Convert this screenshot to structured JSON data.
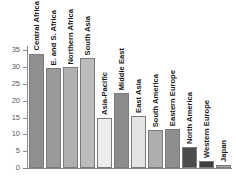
{
  "chart_data": {
    "type": "bar",
    "title": "",
    "subtitle": "",
    "xlabel": "",
    "ylabel": "",
    "categories": [
      "Central Africa",
      "E. and S. Africa",
      "Northern Africa",
      "South Asia",
      "Asia-Pacific",
      "Middle East",
      "East Asia",
      "South America",
      "Eastern Europe",
      "North America",
      "Western Europe",
      "Japan"
    ],
    "values": [
      34.0,
      29.7,
      30.0,
      32.7,
      14.8,
      22.3,
      15.5,
      11.3,
      11.7,
      6.3,
      2.2,
      0.8
    ],
    "bar_colors": [
      "#8f8f8f",
      "#9a9a9a",
      "#b0b0b0",
      "#bcbcbc",
      "#ededed",
      "#8b8b8b",
      "#e4e4e4",
      "#aeaeae",
      "#8e8e8e",
      "#4d4d4d",
      "#3f3f3f",
      "#a5a5a5"
    ],
    "ylim": [
      0,
      36
    ],
    "yticks": [
      0,
      5,
      10,
      15,
      20,
      25,
      30,
      35
    ],
    "ytick_labels": [
      "0",
      "5",
      "10",
      "15",
      "20",
      "25",
      "30",
      "35"
    ],
    "grid": false,
    "legend": "none",
    "axis_color": "#8a8a8a",
    "bar_border_color": "#7b7b7b",
    "label_color": "#1a1a1a",
    "tick_label_color": "#5a5a5a",
    "background": "#ffffff"
  }
}
